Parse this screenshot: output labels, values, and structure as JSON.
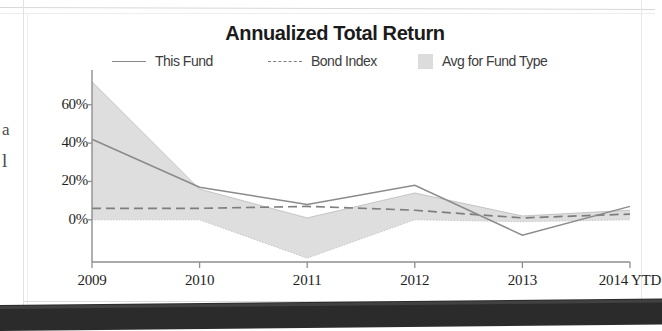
{
  "page": {
    "edge_fragments": [
      "a",
      "l"
    ]
  },
  "chart_data": {
    "type": "line",
    "title": "Annualized Total Return",
    "xlabel": "",
    "ylabel": "",
    "categories": [
      "2009",
      "2010",
      "2011",
      "2012",
      "2013",
      "2014 YTD"
    ],
    "ytick_labels": [
      "0%",
      "20%",
      "40%",
      "60%"
    ],
    "ytick_values": [
      0,
      20,
      40,
      60
    ],
    "ylim": [
      -22,
      75
    ],
    "grid": false,
    "legend_position": "top",
    "series": [
      {
        "name": "This Fund",
        "style": "solid-line",
        "color": "#8a8a8a",
        "values": [
          42,
          17,
          8,
          18,
          -8,
          7
        ]
      },
      {
        "name": "Bond Index",
        "style": "dashed-line",
        "color": "#7e7e7e",
        "values": [
          6,
          6,
          7,
          5,
          1,
          3
        ]
      },
      {
        "name": "Avg for Fund Type",
        "style": "shaded-band",
        "color": "#dcdcdc",
        "band_upper": [
          72,
          16,
          1,
          14,
          2,
          5
        ],
        "band_lower": [
          0,
          0,
          -20,
          0,
          -1,
          0
        ]
      }
    ]
  },
  "legend": {
    "items": [
      {
        "label": "This Fund",
        "marker": "solid-line-swatch"
      },
      {
        "label": "Bond Index",
        "marker": "dashed-line-swatch"
      },
      {
        "label": "Avg for Fund Type",
        "marker": "shaded-box-swatch"
      }
    ]
  }
}
